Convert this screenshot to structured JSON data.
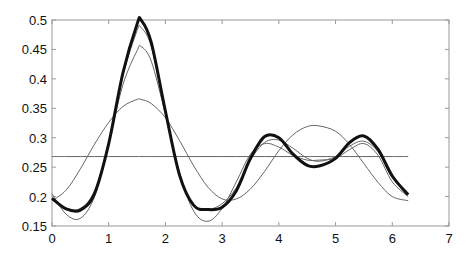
{
  "chart_data": {
    "type": "line",
    "title": "",
    "xlabel": "",
    "ylabel": "",
    "xlim": [
      0,
      7
    ],
    "ylim": [
      0.15,
      0.5
    ],
    "grid": false,
    "legend": null,
    "x_ticks": [
      "0",
      "1",
      "2",
      "3",
      "4",
      "5",
      "6",
      "7"
    ],
    "y_ticks": [
      "0.15",
      "0.2",
      "0.25",
      "0.3",
      "0.35",
      "0.4",
      "0.45",
      "0.5"
    ],
    "x": [
      0,
      0.25,
      0.5,
      0.75,
      1,
      1.25,
      1.5,
      1.57,
      1.75,
      2,
      2.25,
      2.5,
      2.75,
      3,
      3.25,
      3.5,
      3.75,
      4,
      4.25,
      4.5,
      4.71,
      5,
      5.25,
      5.5,
      5.75,
      6,
      6.28
    ],
    "series": [
      {
        "name": "constant",
        "style": "thin",
        "values": [
          0.268,
          0.268,
          0.268,
          0.268,
          0.268,
          0.268,
          0.268,
          0.268,
          0.268,
          0.268,
          0.268,
          0.268,
          0.268,
          0.268,
          0.268,
          0.268,
          0.268,
          0.268,
          0.268,
          0.268,
          0.268,
          0.268,
          0.268,
          0.268,
          0.268,
          0.268,
          0.268
        ]
      },
      {
        "name": "approx-2",
        "style": "thin",
        "values": [
          0.193,
          0.211,
          0.247,
          0.289,
          0.326,
          0.353,
          0.365,
          0.365,
          0.358,
          0.334,
          0.295,
          0.252,
          0.216,
          0.196,
          0.196,
          0.213,
          0.243,
          0.278,
          0.305,
          0.319,
          0.32,
          0.311,
          0.288,
          0.256,
          0.224,
          0.2,
          0.193
        ]
      },
      {
        "name": "approx-3",
        "style": "thin",
        "values": [
          0.205,
          0.17,
          0.163,
          0.2,
          0.29,
          0.39,
          0.448,
          0.455,
          0.43,
          0.34,
          0.24,
          0.175,
          0.158,
          0.18,
          0.225,
          0.272,
          0.29,
          0.284,
          0.27,
          0.262,
          0.262,
          0.265,
          0.28,
          0.29,
          0.27,
          0.225,
          0.2
        ]
      },
      {
        "name": "approx-4",
        "style": "thin",
        "values": [
          0.198,
          0.18,
          0.18,
          0.21,
          0.29,
          0.405,
          0.482,
          0.487,
          0.455,
          0.345,
          0.24,
          0.185,
          0.178,
          0.188,
          0.215,
          0.262,
          0.292,
          0.296,
          0.282,
          0.265,
          0.26,
          0.268,
          0.286,
          0.294,
          0.276,
          0.232,
          0.205
        ]
      },
      {
        "name": "full",
        "style": "bold",
        "values": [
          0.197,
          0.179,
          0.177,
          0.205,
          0.29,
          0.41,
          0.493,
          0.5,
          0.462,
          0.345,
          0.236,
          0.185,
          0.178,
          0.182,
          0.21,
          0.265,
          0.302,
          0.3,
          0.272,
          0.253,
          0.252,
          0.265,
          0.292,
          0.303,
          0.28,
          0.235,
          0.203
        ]
      }
    ]
  }
}
